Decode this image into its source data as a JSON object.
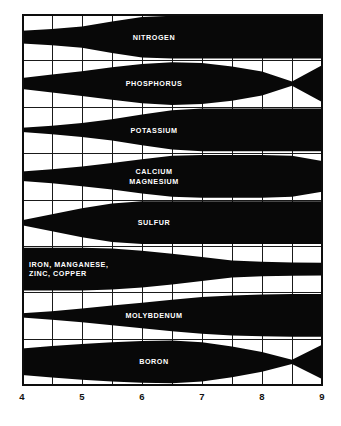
{
  "chart_data": {
    "type": "area",
    "xlabel": "pH",
    "ylabel": "",
    "xlim": [
      4,
      9
    ],
    "grid": true,
    "legend_position": "none",
    "x": [
      4,
      4.5,
      5,
      5.5,
      6,
      6.5,
      7,
      7.5,
      8,
      8.5,
      9
    ],
    "tick_labels": [
      "4",
      "5",
      "6",
      "7",
      "8",
      "9"
    ],
    "tick_values": [
      4,
      5,
      6,
      7,
      8,
      9
    ],
    "minor_gridlines": [
      4.5,
      5.5,
      6.5,
      7.5,
      8.5
    ],
    "series": [
      {
        "name": "NITROGEN",
        "label": "NITROGEN",
        "label_lines": [
          "NITROGEN"
        ],
        "label_align": "center",
        "values": [
          0.3,
          0.38,
          0.5,
          0.74,
          0.95,
          1.0,
          1.0,
          1.0,
          1.0,
          1.0,
          1.0
        ]
      },
      {
        "name": "PHOSPHORUS",
        "label": "PHOSPHORUS",
        "label_lines": [
          "PHOSPHORUS"
        ],
        "label_align": "center",
        "values": [
          0.26,
          0.42,
          0.58,
          0.76,
          0.92,
          1.0,
          0.96,
          0.8,
          0.56,
          0.1,
          0.86
        ]
      },
      {
        "name": "POTASSIUM",
        "label": "POTASSIUM",
        "label_lines": [
          "POTASSIUM"
        ],
        "label_align": "center",
        "values": [
          0.1,
          0.2,
          0.33,
          0.5,
          0.72,
          0.92,
          1.0,
          1.0,
          1.0,
          1.0,
          1.0
        ]
      },
      {
        "name": "CALCIUM MAGNESIUM",
        "label": "CALCIUM MAGNESIUM",
        "label_lines": [
          "CALCIUM",
          "MAGNESIUM"
        ],
        "label_align": "center",
        "values": [
          0.22,
          0.33,
          0.46,
          0.62,
          0.8,
          0.96,
          1.0,
          1.0,
          1.0,
          0.96,
          0.72
        ]
      },
      {
        "name": "SULFUR",
        "label": "SULFUR",
        "label_lines": [
          "SULFUR"
        ],
        "label_align": "center",
        "values": [
          0.12,
          0.4,
          0.68,
          0.9,
          1.0,
          1.0,
          1.0,
          1.0,
          1.0,
          1.0,
          1.0
        ]
      },
      {
        "name": "IRON, MANGANESE, ZINC, COPPER",
        "label": "IRON, MANGANESE, ZINC, COPPER",
        "label_lines": [
          "IRON, MANGANESE,",
          "ZINC, COPPER"
        ],
        "label_align": "left",
        "values": [
          1.0,
          1.0,
          1.0,
          0.96,
          0.86,
          0.72,
          0.56,
          0.4,
          0.34,
          0.31,
          0.3
        ]
      },
      {
        "name": "MOLYBDENUM",
        "label": "MOLYBDENUM",
        "label_lines": [
          "MOLYBDENUM"
        ],
        "label_align": "center",
        "values": [
          0.1,
          0.2,
          0.32,
          0.46,
          0.6,
          0.74,
          0.86,
          0.94,
          0.98,
          1.0,
          1.0
        ]
      },
      {
        "name": "BORON",
        "label": "BORON",
        "label_lines": [
          "BORON"
        ],
        "label_align": "center",
        "values": [
          0.62,
          0.74,
          0.84,
          0.92,
          0.98,
          1.0,
          0.92,
          0.72,
          0.46,
          0.1,
          0.8
        ]
      }
    ]
  },
  "colors": {
    "band_fill": "#080808",
    "grid": "#1a1a1a",
    "frame": "#0d0d0d",
    "background": "#ffffff",
    "label_text": "#ffffff",
    "axis_text": "#111111"
  },
  "geometry": {
    "plot_left": 22,
    "plot_right": 322,
    "plot_top": 14,
    "plot_bottom": 385,
    "row_count": 8,
    "axis_label_y": 400
  }
}
